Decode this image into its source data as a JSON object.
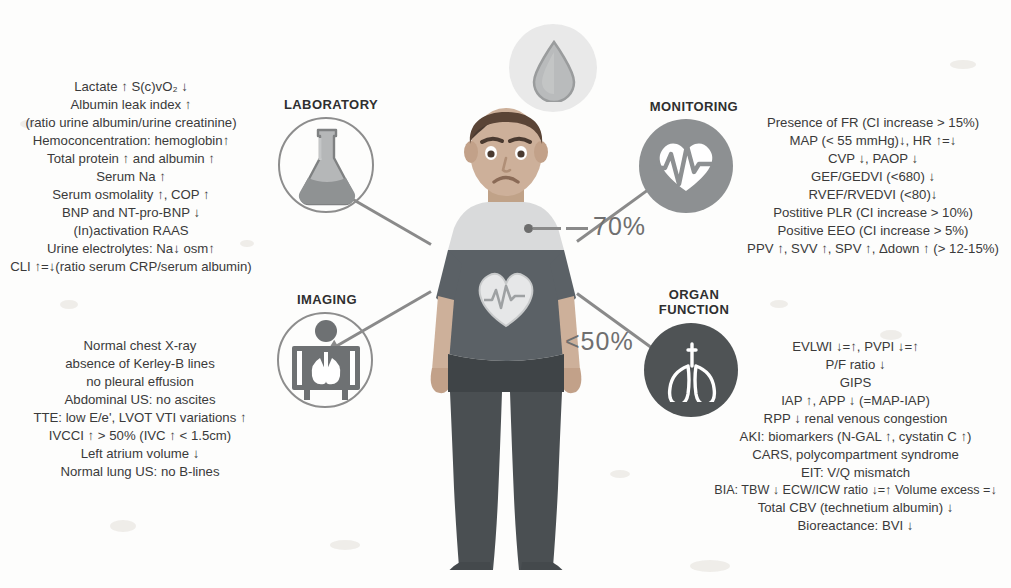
{
  "central_figure": {
    "name": "patient-figure",
    "expression": "sad",
    "shirt_graphic": "heart-with-ecg"
  },
  "droplet": {
    "name": "water-droplet-icon",
    "label": ""
  },
  "percent_labels": [
    {
      "id": "upper",
      "value": "70%",
      "points_to": "heart"
    },
    {
      "id": "lower",
      "value": "<50%",
      "points_to": "lower-body"
    }
  ],
  "sections": [
    {
      "id": "laboratory",
      "header": "LABORATORY",
      "icon": "flask-icon",
      "lines": [
        "Lactate ↑ S(c)vO₂ ↓",
        "Albumin leak index ↑",
        "(ratio urine albumin/urine creatinine)",
        "Hemoconcentration: hemoglobin↑",
        "Total protein ↑ and albumin ↑",
        "Serum Na ↑",
        "Serum osmolality ↑, COP ↑",
        "BNP and NT-pro-BNP ↓",
        "(In)activation RAAS",
        "Urine electrolytes: Na↓ osm↑",
        "CLI ↑=↓(ratio serum CRP/serum albumin)"
      ]
    },
    {
      "id": "monitoring",
      "header": "MONITORING",
      "icon": "heart-monitor-icon",
      "lines": [
        "Presence of FR (CI increase > 15%)",
        "MAP  (< 55 mmHg)↓, HR ↑=↓",
        "CVP ↓, PAOP ↓",
        "GEF/GEDVI (<680) ↓",
        "RVEF/RVEDVI (<80)↓",
        "Postitive PLR (CI increase > 10%)",
        "Positive EEO (CI increase > 5%)",
        "PPV ↑, SVV ↑, SPV ↑, Δdown ↑ (> 12-15%)"
      ]
    },
    {
      "id": "imaging",
      "header": "IMAGING",
      "icon": "xray-viewer-icon",
      "lines": [
        "Normal chest X-ray",
        "absence of Kerley-B lines",
        "no pleural effusion",
        "Abdominal US: no ascites",
        "TTE: low E/e', LVOT VTI variations ↑",
        "IVCCI ↑ > 50%  (IVC ↑ < 1.5cm)",
        "Left atrium volume ↓",
        "Normal lung US: no B-lines"
      ]
    },
    {
      "id": "organ-function",
      "header": "ORGAN\nFUNCTION",
      "header_line1": "ORGAN",
      "header_line2": "FUNCTION",
      "icon": "lungs-icon",
      "lines": [
        "EVLWI ↓=↑, PVPI ↓=↑",
        "P/F ratio ↓",
        "GIPS",
        "IAP ↑, APP ↓ (=MAP-IAP)",
        "RPP ↓ renal venous congestion",
        "AKI: biomarkers (N-GAL ↑, cystatin C ↑)",
        "CARS, polycompartment syndrome",
        "EIT: V/Q mismatch",
        "BIA: TBW ↓ ECW/ICW ratio ↓=↑ Volume excess =↓",
        "Total CBV (technetium albumin) ↓",
        "Bioreactance: BVI ↓"
      ]
    }
  ],
  "colors": {
    "background": "#fdfdfc",
    "text": "#3a3a3a",
    "icon_gray": "#8d8d8d",
    "icon_dark": "#4f5355",
    "arrow": "#8a8a8a",
    "shirt": "#5b6166",
    "pants": "#3f4447",
    "skin": "#cdb09a"
  }
}
